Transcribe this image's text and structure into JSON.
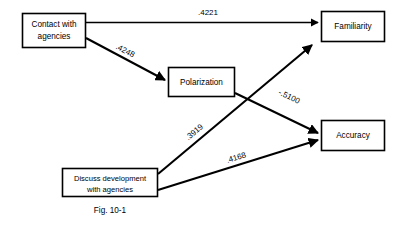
{
  "figure": {
    "caption": "Fig. 10-1",
    "nodes": [
      {
        "id": "contact",
        "line1": "Contact with",
        "line2": "agencies"
      },
      {
        "id": "polarization",
        "line1": "Polarization",
        "line2": ""
      },
      {
        "id": "familiarity",
        "line1": "Familiarity",
        "line2": ""
      },
      {
        "id": "accuracy",
        "line1": "Accuracy",
        "line2": ""
      },
      {
        "id": "discuss",
        "line1": "Discuss development",
        "line2": "with agencies"
      }
    ],
    "edges": [
      {
        "id": "contact-familiarity",
        "from": "Contact with agencies",
        "to": "Familiarity",
        "coefficient": ".4221"
      },
      {
        "id": "contact-polarization",
        "from": "Contact with agencies",
        "to": "Polarization",
        "coefficient": ".4248"
      },
      {
        "id": "polarization-accuracy",
        "from": "Polarization",
        "to": "Accuracy",
        "coefficient": "-.5100"
      },
      {
        "id": "discuss-familiarity",
        "from": "Discuss development with agencies",
        "to": "Familiarity",
        "coefficient": ".3919"
      },
      {
        "id": "discuss-accuracy",
        "from": "Discuss development with agencies",
        "to": "Accuracy",
        "coefficient": ".4168"
      }
    ],
    "colors": {
      "background": "#ffffff",
      "stroke": "#000000",
      "text": "#000000"
    }
  }
}
